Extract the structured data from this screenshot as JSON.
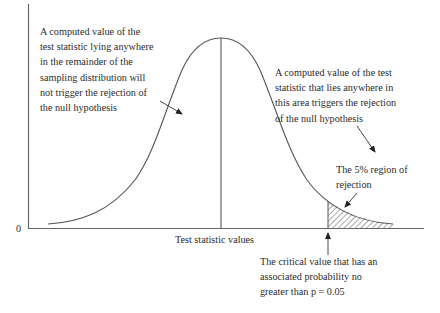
{
  "diagram": {
    "axis": {
      "y_origin_label": "0",
      "x_label": "Test statistic values"
    },
    "annotations": {
      "acceptance_region": {
        "lines": [
          "A computed value of the",
          "test statistic lying anywhere",
          "in the remainder of the",
          "sampling distribution will",
          "not trigger the rejection of",
          "the null hypothesis"
        ]
      },
      "rejection_area": {
        "lines": [
          "A computed value of the test",
          "statistic that lies anywhere in",
          "this area triggers the rejection",
          "of the null hypothesis"
        ]
      },
      "rejection_region": {
        "lines": [
          "The 5% region of",
          "rejection"
        ]
      },
      "critical_value": {
        "lines": [
          "The critical value that has an",
          "associated probability no",
          "greater than p = 0.05"
        ]
      }
    },
    "colors": {
      "line": "#555555",
      "text": "#2b2b2b",
      "hatch": "#555555",
      "background": "#ffffff"
    },
    "parameters": {
      "significance_level": "p = 0.05",
      "rejection_percent": "5%"
    }
  }
}
